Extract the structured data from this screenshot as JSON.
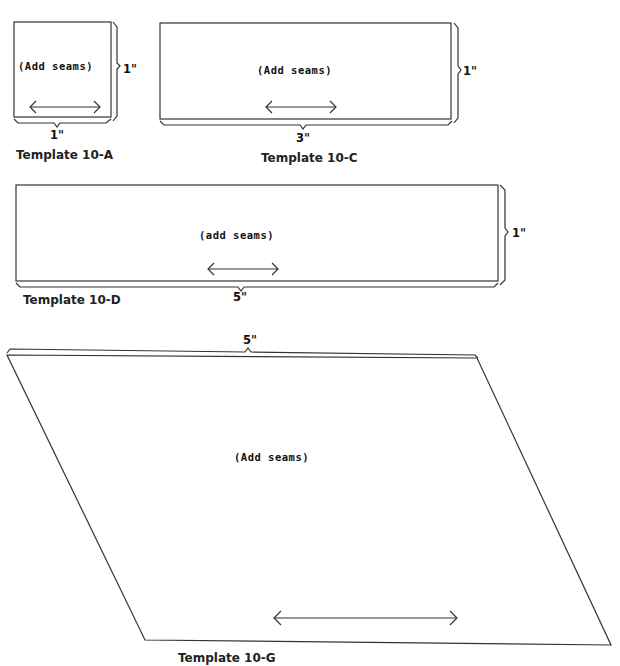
{
  "templates": [
    {
      "id": "10-A",
      "label": "Template 10-A",
      "note": "(Add seams)",
      "width": "1\"",
      "height": "1\""
    },
    {
      "id": "10-C",
      "label": "Template 10-C",
      "note": "(Add seams)",
      "width": "3\"",
      "height": "1\""
    },
    {
      "id": "10-D",
      "label": "Template 10-D",
      "note": "(add seams)",
      "width": "5\"",
      "height": "1\""
    },
    {
      "id": "10-G",
      "label": "Template 10-G",
      "note": "(Add seams)",
      "width": "5\""
    }
  ],
  "icons": {
    "grain_arrow": "double-headed-arrow",
    "dimension_brace": "brace"
  },
  "colors": {
    "line": "#222222",
    "background": "#ffffff"
  }
}
